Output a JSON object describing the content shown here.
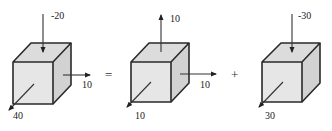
{
  "diagram": {
    "colors": {
      "edge": "#2a2a2a",
      "face": "#e6e6e6",
      "arrow": "#222222"
    },
    "cubes": [
      {
        "name": "original",
        "vertical": {
          "value": "-20",
          "direction": "down"
        },
        "horizontal": {
          "value": "10",
          "direction": "right"
        },
        "depth": {
          "value": "40",
          "direction": "out"
        }
      },
      {
        "name": "hydrostatic",
        "vertical": {
          "value": "10",
          "direction": "up"
        },
        "horizontal": {
          "value": "10",
          "direction": "right"
        },
        "depth": {
          "value": "10",
          "direction": "out"
        }
      },
      {
        "name": "deviatoric",
        "vertical": {
          "value": "-30",
          "direction": "down"
        },
        "horizontal": null,
        "depth": {
          "value": "30",
          "direction": "out"
        }
      }
    ],
    "operators": [
      "=",
      "+"
    ]
  }
}
